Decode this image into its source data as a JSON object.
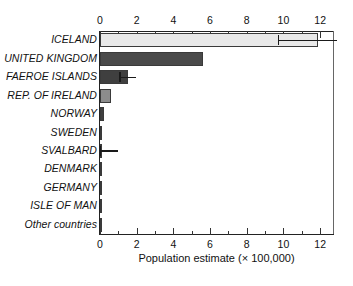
{
  "chart_data": {
    "type": "bar",
    "orientation": "horizontal",
    "title": "",
    "xlabel": "Population estimate (× 100,000)",
    "ylabel": "",
    "xlim": [
      0,
      12.7
    ],
    "xticks": [
      0,
      2,
      4,
      6,
      8,
      10,
      12
    ],
    "xtick_labels": [
      "0",
      "2",
      "4",
      "6",
      "8",
      "10",
      "12"
    ],
    "minor_tick_step": 1,
    "grid": false,
    "legend": "none",
    "dual_x_axis": true,
    "categories": [
      "ICELAND",
      "UNITED KINGDOM",
      "FAEROE ISLANDS",
      "REP. OF IRELAND",
      "NORWAY",
      "SWEDEN",
      "SVALBARD",
      "DENMARK",
      "GERMANY",
      "ISLE OF MAN",
      "Other countries"
    ],
    "values": [
      11.9,
      5.6,
      1.5,
      0.6,
      0.2,
      0.06,
      0.03,
      0.02,
      0.02,
      0.02,
      0.02
    ],
    "errors_upper": [
      1.0,
      0.0,
      0.45,
      0.0,
      0.0,
      0.0,
      0.95,
      0.0,
      0.0,
      0.0,
      0.0
    ],
    "error_bar_start": [
      9.7,
      null,
      1.05,
      null,
      null,
      null,
      0.0,
      null,
      null,
      null,
      null
    ],
    "bar_colors": [
      "#e9e9e9",
      "#4a4a4a",
      "#3f3f3f",
      "#8c8c8c",
      "#3f3f3f",
      "#3a3a3a",
      "#3a3a3a",
      "#3a3a3a",
      "#3a3a3a",
      "#3a3a3a",
      "#3a3a3a"
    ],
    "bar_border_color": "#3a3a3a",
    "axis_color": "#222222",
    "has_error_bars": [
      true,
      false,
      true,
      false,
      false,
      false,
      true,
      false,
      false,
      false,
      false
    ]
  }
}
